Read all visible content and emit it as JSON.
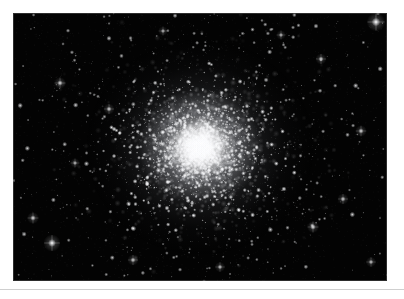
{
  "page": {
    "background_color": "#ffffff",
    "bottom_rule_color": "#cfcfcf"
  },
  "photo": {
    "subject": "globular star cluster",
    "frame": {
      "x": 13,
      "y": 13,
      "width": 374,
      "height": 268
    },
    "sky_background_color": "#030303",
    "star_color": "#ffffff",
    "core_glow_color": "#ffffff",
    "alt_text": "Black-and-white astronomical photograph of a dense globular star cluster with a bright unresolved core and thousands of resolved member stars fading into a sparse field of foreground stars."
  },
  "chart_data": {
    "type": "scatter",
    "title": "",
    "xlabel": "",
    "ylabel": "",
    "xlim": [
      0,
      374
    ],
    "ylim": [
      0,
      268
    ],
    "grid": false,
    "legend": null,
    "cluster": {
      "center_x": 187,
      "center_y": 135,
      "core_radius": 26,
      "half_light_radius": 62,
      "tidal_radius": 150,
      "member_star_count": 5200,
      "core_glow_peak_brightness": 1.0
    },
    "field": {
      "field_star_count": 420,
      "background_level": 0.012
    },
    "bright_field_stars": [
      {
        "x": 363,
        "y": 9,
        "size": 5.0,
        "brightness": 1.0
      },
      {
        "x": 39,
        "y": 230,
        "size": 4.6,
        "brightness": 0.98
      },
      {
        "x": 20,
        "y": 205,
        "size": 3.2,
        "brightness": 0.8
      },
      {
        "x": 96,
        "y": 96,
        "size": 3.0,
        "brightness": 0.78
      },
      {
        "x": 47,
        "y": 70,
        "size": 3.2,
        "brightness": 0.82
      },
      {
        "x": 308,
        "y": 46,
        "size": 3.0,
        "brightness": 0.76
      },
      {
        "x": 348,
        "y": 118,
        "size": 3.1,
        "brightness": 0.8
      },
      {
        "x": 330,
        "y": 186,
        "size": 3.0,
        "brightness": 0.75
      },
      {
        "x": 300,
        "y": 214,
        "size": 3.2,
        "brightness": 0.82
      },
      {
        "x": 120,
        "y": 247,
        "size": 3.0,
        "brightness": 0.76
      },
      {
        "x": 207,
        "y": 254,
        "size": 2.8,
        "brightness": 0.72
      },
      {
        "x": 62,
        "y": 150,
        "size": 2.6,
        "brightness": 0.7
      },
      {
        "x": 358,
        "y": 249,
        "size": 2.8,
        "brightness": 0.72
      },
      {
        "x": 268,
        "y": 22,
        "size": 2.6,
        "brightness": 0.68
      },
      {
        "x": 150,
        "y": 18,
        "size": 2.6,
        "brightness": 0.66
      }
    ]
  }
}
